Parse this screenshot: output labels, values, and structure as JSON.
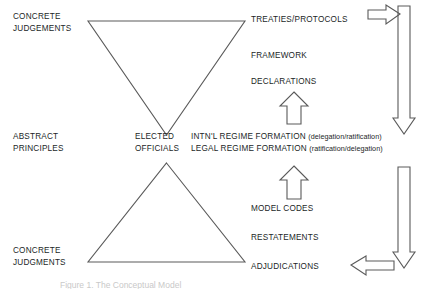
{
  "figure": {
    "caption": "Figure 1. The Conceptual Model",
    "colors": {
      "stroke": "#5a5a5a",
      "text": "#221f1f",
      "background": "#ffffff",
      "caption": "#c9c9c9"
    }
  },
  "left_axis": {
    "top": {
      "line1": "CONCRETE",
      "line2": "JUDGEMENTS"
    },
    "middle": {
      "line1": "ABSTRACT",
      "line2": "PRINCIPLES"
    },
    "bottom": {
      "line1": "CONCRETE",
      "line2": "JUDGMENTS"
    }
  },
  "center": {
    "actor": {
      "line1": "ELECTED",
      "line2": "OFFICIALS"
    },
    "upper_shape": "inverted-triangle",
    "lower_shape": "upright-triangle",
    "arrow_upper": "up-arrow",
    "arrow_lower": "up-arrow"
  },
  "right_column": {
    "upper_items": [
      "TREATIES/PROTOCOLS",
      "FRAMEWORK",
      "DECLARATIONS"
    ],
    "middle_rows": [
      {
        "label": "INTN'L REGIME FORMATION",
        "paren": "(delegation/ratification)"
      },
      {
        "label": "LEGAL REGIME FORMATION",
        "paren": "(ratification/delegation)"
      }
    ],
    "lower_items": [
      "MODEL CODES",
      "RESTATEMENTS",
      "ADJUDICATIONS"
    ]
  },
  "flow_arrows": {
    "top_right_horizontal": "right-arrow",
    "right_upper_vertical": "down-arrow",
    "right_lower_vertical": "down-arrow",
    "bottom_right_horizontal": "left-arrow"
  }
}
